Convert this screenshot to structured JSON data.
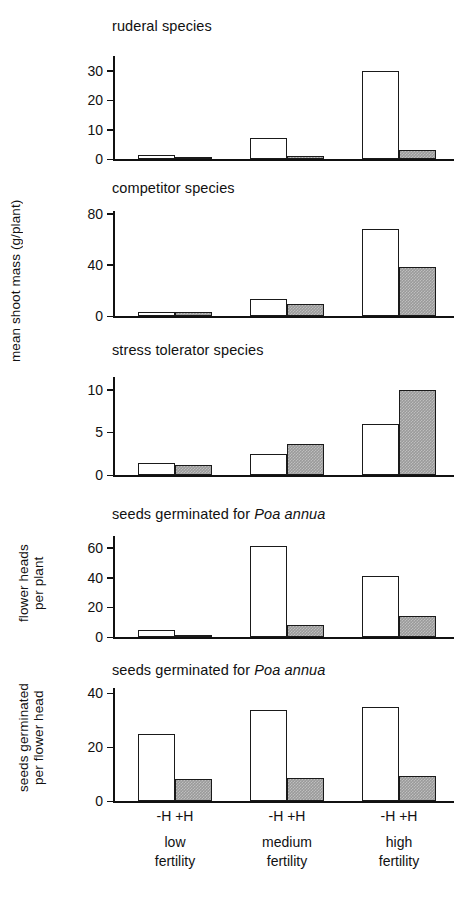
{
  "figure": {
    "width": 461,
    "height": 902,
    "bar_colors": {
      "minus_H": "#ffffff",
      "plus_H": "#9a9a9a",
      "outline": "#1a1a1a"
    },
    "group_labels": [
      "low\nfertility",
      "medium\nfertility",
      "high\nfertility"
    ],
    "treatment_labels": [
      "-H",
      "+H"
    ],
    "axis_titles": [
      {
        "text": "mean shoot mass (g/plant)"
      },
      {
        "text": "flower heads\nper plant"
      },
      {
        "text": "seeds germinated\nper flower head"
      }
    ]
  },
  "chart_data": [
    {
      "type": "bar",
      "title": "ruderal species",
      "xlabel": "",
      "ylabel": "mean shoot mass (g/plant)",
      "categories": [
        "low fertility",
        "medium fertility",
        "high fertility"
      ],
      "series": [
        {
          "name": "-H",
          "values": [
            1.5,
            7.0,
            30.0
          ]
        },
        {
          "name": "+H",
          "values": [
            0.2,
            1.0,
            3.2
          ]
        }
      ],
      "ylim": [
        0,
        35
      ],
      "yticks": [
        0,
        10,
        20,
        30
      ],
      "grid": false,
      "legend": "none"
    },
    {
      "type": "bar",
      "title": "competitor species",
      "xlabel": "",
      "ylabel": "mean shoot mass (g/plant)",
      "categories": [
        "low fertility",
        "medium fertility",
        "high fertility"
      ],
      "series": [
        {
          "name": "-H",
          "values": [
            3.0,
            13.0,
            68.0
          ]
        },
        {
          "name": "+H",
          "values": [
            3.5,
            9.5,
            38.0
          ]
        }
      ],
      "ylim": [
        0,
        82
      ],
      "yticks": [
        0,
        40,
        80
      ],
      "grid": false,
      "legend": "none"
    },
    {
      "type": "bar",
      "title": "stress tolerator species",
      "xlabel": "",
      "ylabel": "mean shoot mass (g/plant)",
      "categories": [
        "low fertility",
        "medium fertility",
        "high fertility"
      ],
      "series": [
        {
          "name": "-H",
          "values": [
            1.4,
            2.5,
            6.0
          ]
        },
        {
          "name": "+H",
          "values": [
            1.2,
            3.6,
            10.0
          ]
        }
      ],
      "ylim": [
        0,
        11.5
      ],
      "yticks": [
        0,
        5,
        10
      ],
      "grid": false,
      "legend": "none"
    },
    {
      "type": "bar",
      "title": "seeds germinated for Poa annua",
      "title_italic_part": "Poa annua",
      "xlabel": "",
      "ylabel": "flower heads per plant",
      "categories": [
        "low fertility",
        "medium fertility",
        "high fertility"
      ],
      "series": [
        {
          "name": "-H",
          "values": [
            5.0,
            61.0,
            41.0
          ]
        },
        {
          "name": "+H",
          "values": [
            1.5,
            8.0,
            14.0
          ]
        }
      ],
      "ylim": [
        0,
        68
      ],
      "yticks": [
        0,
        20,
        40,
        60
      ],
      "grid": false,
      "legend": "none"
    },
    {
      "type": "bar",
      "title": "seeds germinated for Poa annua",
      "title_italic_part": "Poa annua",
      "xlabel": "",
      "ylabel": "seeds germinated per flower head",
      "categories": [
        "low fertility",
        "medium fertility",
        "high fertility"
      ],
      "series": [
        {
          "name": "-H",
          "values": [
            25.0,
            34.0,
            35.0
          ]
        },
        {
          "name": "+H",
          "values": [
            8.0,
            8.5,
            9.2
          ]
        }
      ],
      "ylim": [
        0,
        42
      ],
      "yticks": [
        0,
        20,
        40
      ],
      "grid": false,
      "legend": "none"
    }
  ]
}
